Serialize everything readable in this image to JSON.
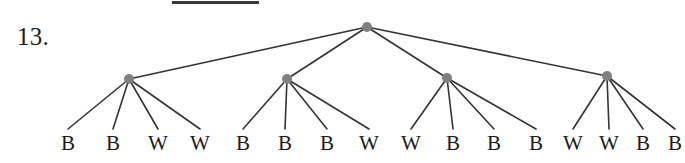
{
  "problem": {
    "number_label": "13."
  },
  "top_rule": {
    "present": true,
    "color": "#3a3a3a",
    "x": 172,
    "y": 1,
    "width": 87,
    "height": 3
  },
  "diagram": {
    "type": "rooted-tree",
    "edge_color": "#333333",
    "node_color": "#808080",
    "node_radius": 5,
    "root": {
      "id": "root",
      "x": 367,
      "y": 27
    },
    "internal_nodes": [
      {
        "id": "n1",
        "x": 129,
        "y": 79
      },
      {
        "id": "n2",
        "x": 287,
        "y": 79
      },
      {
        "id": "n3",
        "x": 447,
        "y": 78
      },
      {
        "id": "n4",
        "x": 607,
        "y": 76
      }
    ],
    "leaf_y": 129,
    "label_y": 133,
    "groups": [
      {
        "parent": "n1",
        "leaves": [
          {
            "label": "B",
            "x": 68
          },
          {
            "label": "B",
            "x": 113
          },
          {
            "label": "W",
            "x": 158
          },
          {
            "label": "W",
            "x": 200
          }
        ]
      },
      {
        "parent": "n2",
        "leaves": [
          {
            "label": "B",
            "x": 243
          },
          {
            "label": "B",
            "x": 285
          },
          {
            "label": "B",
            "x": 327
          },
          {
            "label": "W",
            "x": 369
          }
        ]
      },
      {
        "parent": "n3",
        "leaves": [
          {
            "label": "W",
            "x": 411
          },
          {
            "label": "B",
            "x": 453
          },
          {
            "label": "B",
            "x": 494
          },
          {
            "label": "B",
            "x": 536
          }
        ]
      },
      {
        "parent": "n4",
        "leaves": [
          {
            "label": "W",
            "x": 573
          },
          {
            "label": "W",
            "x": 609
          },
          {
            "label": "B",
            "x": 643
          },
          {
            "label": "B",
            "x": 675
          }
        ]
      }
    ],
    "leaf_sequence": "B B W W B B B W W B B B W W B B"
  }
}
